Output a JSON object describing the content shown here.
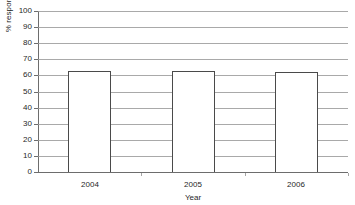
{
  "chart_data": {
    "type": "bar",
    "title": "",
    "subtitle": "",
    "categories": [
      "2004",
      "2005",
      "2006"
    ],
    "values": [
      63,
      63,
      62
    ],
    "series": [
      {
        "name": "% respondents",
        "values": [
          63,
          63,
          62
        ]
      }
    ],
    "xlabel": "Year",
    "ylabel": "% respondents",
    "ylim": [
      0,
      100
    ],
    "ytick_labels": [
      "0",
      "10",
      "20",
      "30",
      "40",
      "50",
      "60",
      "70",
      "80",
      "90",
      "100"
    ],
    "ytick_values": [
      0,
      10,
      20,
      30,
      40,
      50,
      60,
      70,
      80,
      90,
      100
    ],
    "xtick_labels": [
      "2004",
      "2005",
      "2006"
    ],
    "grid": "horizontal",
    "legend": "none",
    "bar_fill": "#ffffff",
    "bar_edge": "#4a4a4a",
    "gridline_color": "#9a9a9a",
    "axis_color": "#6d6d6d",
    "background": "#ffffff"
  }
}
